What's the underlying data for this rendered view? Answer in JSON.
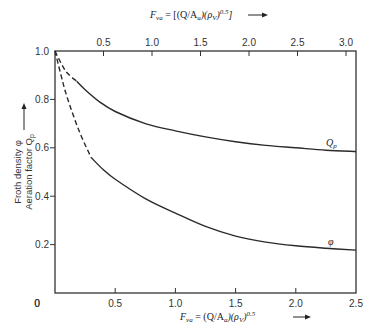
{
  "chart_data": {
    "type": "line",
    "title": "",
    "xlabel": "F_va = (Q/A_a)(ρ_V)^0.5 →",
    "xlabel_top": "F_va = [(Q/A_a)(ρ_V)^0.5] →",
    "ylabel_line1": "Froth density φ",
    "ylabel_line2": "Aeration factor Q_p",
    "xlim": [
      0,
      2.5
    ],
    "xlim_top": [
      0,
      3.1
    ],
    "ylim": [
      0,
      1.0
    ],
    "x_ticks": [
      "0",
      "0.5",
      "1.0",
      "1.5",
      "2.0",
      "2.5"
    ],
    "x_ticks_top": [
      "0.5",
      "1.0",
      "1.5",
      "2.0",
      "2.5",
      "3.0"
    ],
    "y_ticks": [
      "0",
      "0.2",
      "0.4",
      "0.6",
      "0.8",
      "1.0"
    ],
    "grid": false,
    "legend": "inline labels at right end of curves",
    "series": [
      {
        "name": "Q_p",
        "label": "Qp",
        "dashed_until_x": 0.18,
        "x": [
          0,
          0.05,
          0.1,
          0.18,
          0.25,
          0.37,
          0.5,
          0.75,
          1.0,
          1.25,
          1.5,
          1.75,
          2.0,
          2.25,
          2.5
        ],
        "values": [
          1.0,
          0.95,
          0.91,
          0.875,
          0.84,
          0.79,
          0.75,
          0.7,
          0.67,
          0.645,
          0.625,
          0.61,
          0.6,
          0.59,
          0.585
        ]
      },
      {
        "name": "φ",
        "label": "φ",
        "dashed_until_x": 0.3,
        "x": [
          0,
          0.05,
          0.1,
          0.2,
          0.3,
          0.4,
          0.5,
          0.75,
          1.0,
          1.25,
          1.5,
          1.75,
          2.0,
          2.25,
          2.5
        ],
        "values": [
          1.0,
          0.9,
          0.81,
          0.67,
          0.56,
          0.51,
          0.47,
          0.39,
          0.33,
          0.275,
          0.235,
          0.21,
          0.195,
          0.185,
          0.177
        ]
      }
    ]
  },
  "labels": {
    "top_axis_title_main": "F",
    "top_axis_title_sub": "va",
    "top_axis_title_rest": " = [(Q/A",
    "top_axis_title_a": "a",
    "top_axis_title_mid": ")(ρ",
    "top_axis_title_v": "V",
    "top_axis_title_end": ")",
    "top_axis_title_exp": "0.5",
    "top_axis_title_close": "]",
    "bottom_axis_title_main": "F",
    "bottom_axis_title_sub": "va",
    "bottom_axis_title_rest": " = (Q/A",
    "bottom_axis_title_a": "a",
    "bottom_axis_title_mid": ")(ρ",
    "bottom_axis_title_v": "V",
    "bottom_axis_title_end": ")",
    "bottom_axis_title_exp": "0.5",
    "ylabel_line1": "Froth density φ",
    "ylabel_line2": "Aeration factor Q",
    "ylabel_line2_sub": "p",
    "series_qp": "Q",
    "series_qp_sub": "p",
    "series_phi": "φ"
  },
  "colors": {
    "line": "#2a2a2a",
    "axis": "#333333"
  }
}
